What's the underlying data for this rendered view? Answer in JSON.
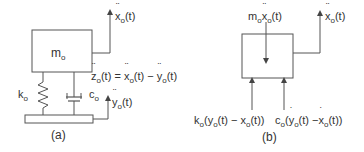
{
  "figure": {
    "panel_a": {
      "caption": "(a)",
      "mass_label": {
        "base": "m",
        "sub": "o"
      },
      "spring_label": {
        "base": "k",
        "sub": "o"
      },
      "damper_label": {
        "base": "c",
        "sub": "o"
      },
      "mass_accel_label": {
        "base": "x",
        "sub": "o",
        "tail": "(t)"
      },
      "base_accel_label": {
        "base": "y",
        "sub": "o",
        "tail": "(t)"
      },
      "relative_eq": {
        "z": "z",
        "z_sub": "o",
        "t1": "(t) = ",
        "x": "x",
        "x_sub": "o",
        "t2": "(t) − ",
        "y": "y",
        "y_sub": "o",
        "t3": "(t)"
      }
    },
    "panel_b": {
      "caption": "(b)",
      "inertia_label": {
        "m": "m",
        "m_sub": "o",
        "x": "x",
        "x_sub": "o",
        "tail": "(t)"
      },
      "output_label": {
        "base": "x",
        "sub": "o",
        "tail": "(t)"
      },
      "spring_force_label": {
        "k": "k",
        "k_sub": "o",
        "p1": "(",
        "y": "y",
        "y_sub": "o",
        "p2": "(t) − ",
        "x": "x",
        "x_sub": "o",
        "p3": "(t))"
      },
      "damper_force_label": {
        "c": "c",
        "c_sub": "o",
        "p1": "(",
        "y": "y",
        "y_sub": "o",
        "p2": "(t) −",
        "x": "x",
        "x_sub": "o",
        "p3": "(t))"
      }
    },
    "colors": {
      "line": "#555555",
      "text": "#333333"
    }
  }
}
